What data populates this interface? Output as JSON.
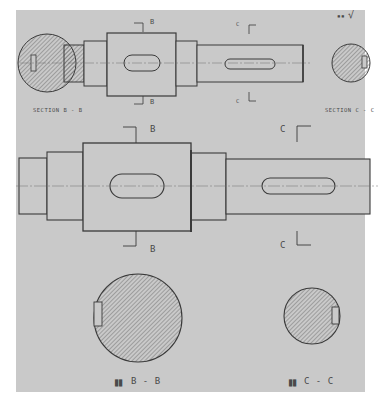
{
  "drawing": {
    "type": "shaft detail drawing with sections",
    "surface_finish_symbol": "√",
    "surface_finish_prefix": "▪▪",
    "colors": {
      "paper": "#c9c9c9",
      "line": "#3a3a3a",
      "hatch": "#5a5a5a",
      "centerline": "#6e6e6e",
      "text": "#4a4a4a"
    }
  },
  "top_view": {
    "section_b_label": "SECTION B - B",
    "section_c_label": "SECTION C - C",
    "marker_b_top": "B",
    "marker_b_bottom": "B",
    "marker_c_top": "C",
    "marker_c_bottom": "C"
  },
  "main_view": {
    "marker_b_top": "B",
    "marker_b_bottom": "B",
    "marker_c_top": "C",
    "marker_c_bottom": "C"
  },
  "bottom_view": {
    "section_b_prefix": "▉▉",
    "section_b_label": "B - B",
    "section_c_prefix": "▉▉",
    "section_c_label": "C - C"
  }
}
